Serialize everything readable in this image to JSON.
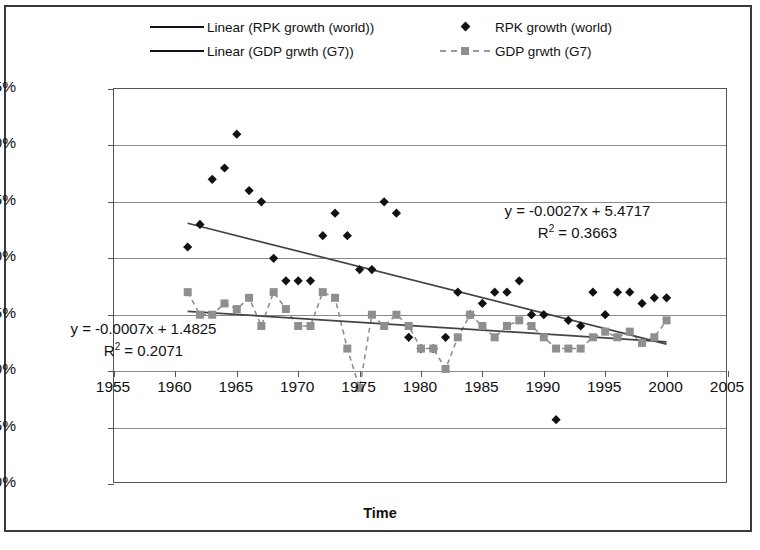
{
  "chart_data": {
    "type": "scatter",
    "title": "",
    "xlabel": "Time",
    "ylabel": "% change",
    "xlim": [
      1955,
      2005
    ],
    "ylim": [
      -10,
      25
    ],
    "xticks": [
      1955,
      1960,
      1965,
      1970,
      1975,
      1980,
      1985,
      1990,
      1995,
      2000,
      2005
    ],
    "yticks": [
      25,
      20,
      15,
      10,
      5,
      0,
      -5,
      -10
    ],
    "ytick_labels": [
      "25%",
      "20%",
      "15%",
      "10%",
      "5%",
      "0%",
      "-5%",
      "-10%"
    ],
    "xtick_labels": [
      "1955",
      "1960",
      "1965",
      "1970",
      "1975",
      "1980",
      "1985",
      "1990",
      "1995",
      "2000",
      "2005"
    ],
    "grid": true,
    "grid_axis": "y",
    "legend_position": "top",
    "series": [
      {
        "name": "RPK growth (world)",
        "marker": "diamond",
        "color": "#111111",
        "x": [
          1961,
          1962,
          1963,
          1964,
          1965,
          1966,
          1967,
          1968,
          1969,
          1970,
          1971,
          1972,
          1973,
          1974,
          1975,
          1976,
          1977,
          1978,
          1979,
          1980,
          1981,
          1982,
          1983,
          1984,
          1985,
          1986,
          1987,
          1988,
          1989,
          1990,
          1991,
          1992,
          1993,
          1994,
          1995,
          1996,
          1997,
          1998,
          1999,
          2000
        ],
        "y": [
          11.0,
          13.0,
          17.0,
          18.0,
          21.0,
          16.0,
          15.0,
          10.0,
          8.0,
          8.0,
          8.0,
          12.0,
          14.0,
          12.0,
          9.0,
          9.0,
          15.0,
          14.0,
          3.0,
          2.0,
          2.0,
          3.0,
          7.0,
          5.0,
          6.0,
          7.0,
          7.0,
          8.0,
          5.0,
          5.0,
          -4.3,
          4.5,
          4.0,
          7.0,
          5.0,
          7.0,
          7.0,
          6.0,
          6.5,
          6.5
        ]
      },
      {
        "name": "GDP grwth (G7)",
        "marker": "square",
        "color": "#8f8f8f",
        "line": "dashed",
        "x": [
          1961,
          1962,
          1963,
          1964,
          1965,
          1966,
          1967,
          1968,
          1969,
          1970,
          1971,
          1972,
          1973,
          1974,
          1975,
          1976,
          1977,
          1978,
          1979,
          1980,
          1981,
          1982,
          1983,
          1984,
          1985,
          1986,
          1987,
          1988,
          1989,
          1990,
          1991,
          1992,
          1993,
          1994,
          1995,
          1996,
          1997,
          1998,
          1999,
          2000
        ],
        "y": [
          7.0,
          5.0,
          5.0,
          6.0,
          5.5,
          6.5,
          4.0,
          7.0,
          5.5,
          4.0,
          4.0,
          7.0,
          6.5,
          2.0,
          -1.5,
          5.0,
          4.0,
          5.0,
          4.0,
          2.0,
          2.0,
          0.2,
          3.0,
          5.0,
          4.0,
          3.0,
          4.0,
          4.5,
          4.0,
          3.0,
          2.0,
          2.0,
          2.0,
          3.0,
          3.5,
          3.0,
          3.5,
          2.5,
          3.0,
          4.5
        ]
      }
    ],
    "trendlines": [
      {
        "name": "Linear (RPK growth (world))",
        "equation": "y = -0.0027x + 5.4717",
        "r_squared_label": "R2 = 0.3663",
        "slope": -0.0027,
        "intercept": 5.4717,
        "r_squared": 0.3663,
        "color": "#444444",
        "x_start": 1961,
        "x_end": 2000,
        "y_start": 13.1,
        "y_end": 2.4
      },
      {
        "name": "Linear (GDP grwth (G7))",
        "equation": "y = -0.0007x + 1.4825",
        "r_squared_label": "R2 = 0.2071",
        "slope": -0.0007,
        "intercept": 1.4825,
        "r_squared": 0.2071,
        "color": "#444444",
        "x_start": 1961,
        "x_end": 2000,
        "y_start": 5.3,
        "y_end": 2.6
      }
    ]
  },
  "legend": {
    "entries": [
      {
        "label": "Linear (RPK growth (world))",
        "sample": "solid-line",
        "row": 1,
        "col": 1
      },
      {
        "label": "RPK growth (world)",
        "sample": "diamond-marker",
        "row": 1,
        "col": 2
      },
      {
        "label": "Linear (GDP grwth (G7))",
        "sample": "solid-line",
        "row": 2,
        "col": 1
      },
      {
        "label": "GDP grwth (G7)",
        "sample": "dashed-square-marker",
        "row": 2,
        "col": 2
      }
    ]
  },
  "annotations": {
    "rpk_equation": "y = -0.0027x + 5.4717",
    "rpk_r2_prefix": "R",
    "rpk_r2_sup": "2",
    "rpk_r2_value": " = 0.3663",
    "gdp_equation": "y = -0.0007x + 1.4825",
    "gdp_r2_prefix": "R",
    "gdp_r2_sup": "2",
    "gdp_r2_value": " = 0.2071"
  },
  "axes": {
    "y_title": "% change",
    "x_title": "Time"
  },
  "colors": {
    "rpk_marker": "#111111",
    "gdp_marker": "#8f8f8f",
    "trendline": "#444444",
    "gridline": "#8a8a8a",
    "frame": "#555555",
    "border": "#3a3a3a"
  }
}
